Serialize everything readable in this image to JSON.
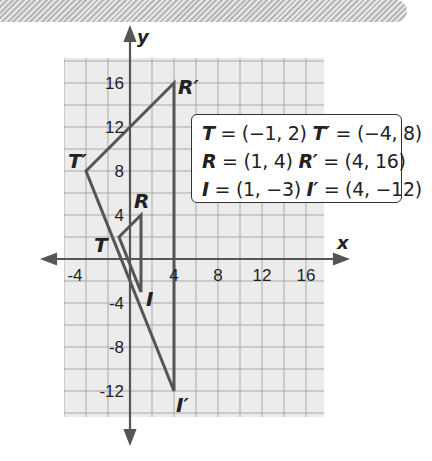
{
  "banner": {
    "pattern": "diagonal-hatch",
    "color": "#b8b8b8"
  },
  "graph": {
    "x_label": "x",
    "y_label": "y",
    "x_ticks": [
      "-4",
      "4",
      "8",
      "12",
      "16"
    ],
    "y_ticks": [
      "16",
      "12",
      "8",
      "4",
      "-4",
      "-8",
      "-12"
    ],
    "grid_step": 2,
    "x_range": [
      -6,
      17.6
    ],
    "y_range": [
      -14.2,
      18.3
    ],
    "grid_color": "#a8a8a8",
    "background": "#ececec",
    "line_color": "#555555"
  },
  "triangle_original": {
    "vertices": [
      {
        "name": "T",
        "x": -1,
        "y": 2
      },
      {
        "name": "R",
        "x": 1,
        "y": 4
      },
      {
        "name": "I",
        "x": 1,
        "y": -3
      }
    ]
  },
  "triangle_image": {
    "vertices": [
      {
        "name": "T′",
        "x": -4,
        "y": 8
      },
      {
        "name": "R′",
        "x": 4,
        "y": 16
      },
      {
        "name": "I′",
        "x": 4,
        "y": -12
      }
    ]
  },
  "legend": {
    "rows": [
      {
        "v1": "T",
        "c1": " = (−1, 2)  ",
        "v2": "T′",
        "c2": " = (−4, 8)"
      },
      {
        "v1": "R",
        "c1": " = (1, 4)  ",
        "v2": "R′",
        "c2": " = (4, 16)"
      },
      {
        "v1": "I",
        "c1": " = (1, −3)  ",
        "v2": "I′",
        "c2": " = (4, −12)"
      }
    ]
  },
  "labels": {
    "T": "T",
    "R": "R",
    "I": "I",
    "T_prime": "T′",
    "R_prime": "R′",
    "I_prime": "I′"
  }
}
